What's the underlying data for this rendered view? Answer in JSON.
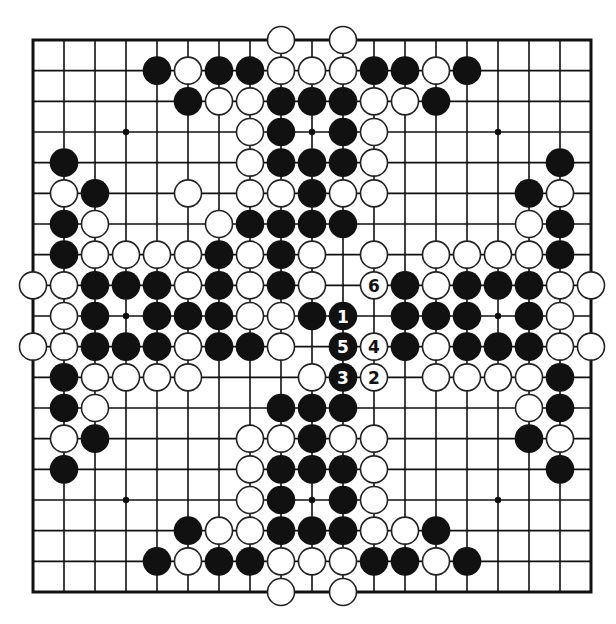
{
  "diagram": {
    "type": "go-board",
    "size": 19,
    "geometry": {
      "left": 33,
      "top": 40,
      "right": 591,
      "bottom": 592,
      "stone_radius": 14.3,
      "border_width": 3,
      "line_width": 1.6,
      "star_radius": 3.2
    },
    "colors": {
      "background": "#ffffff",
      "line": "#111111",
      "black_stone": "#111111",
      "white_stone": "#ffffff",
      "white_stone_edge": "#222222",
      "number_on_black": "#ffffff",
      "number_on_white": "#111111"
    },
    "star_points": [
      [
        3,
        3
      ],
      [
        3,
        9
      ],
      [
        3,
        15
      ],
      [
        9,
        3
      ],
      [
        9,
        9
      ],
      [
        9,
        15
      ],
      [
        15,
        3
      ],
      [
        15,
        9
      ],
      [
        15,
        15
      ]
    ],
    "stones": {
      "rows": [
        {
          "row": 0,
          "black": [],
          "white": [
            8,
            10
          ]
        },
        {
          "row": 1,
          "black": [
            4,
            6,
            7,
            11,
            12,
            14
          ],
          "white": [
            5,
            8,
            9,
            10,
            13
          ]
        },
        {
          "row": 2,
          "black": [
            5,
            8,
            9,
            10,
            13
          ],
          "white": [
            6,
            7,
            11,
            12
          ]
        },
        {
          "row": 3,
          "black": [
            8,
            10
          ],
          "white": [
            7,
            11
          ]
        },
        {
          "row": 4,
          "black": [
            1,
            8,
            9,
            10,
            17
          ],
          "white": [
            7,
            11
          ]
        },
        {
          "row": 5,
          "black": [
            2,
            9,
            16
          ],
          "white": [
            1,
            5,
            7,
            8,
            10,
            11,
            17
          ]
        },
        {
          "row": 6,
          "black": [
            1,
            7,
            8,
            9,
            10,
            17
          ],
          "white": [
            2,
            6,
            16
          ]
        },
        {
          "row": 7,
          "black": [
            1,
            6,
            8,
            17
          ],
          "white": [
            2,
            3,
            4,
            5,
            7,
            9,
            11,
            13,
            14,
            15,
            16
          ]
        },
        {
          "row": 8,
          "black": [
            2,
            3,
            4,
            6,
            8,
            12,
            14,
            15,
            16
          ],
          "white": [
            0,
            1,
            5,
            7,
            9,
            13,
            17,
            18
          ]
        },
        {
          "row": 9,
          "black": [
            2,
            4,
            5,
            6,
            9,
            12,
            13,
            14,
            16
          ],
          "white": [
            1,
            7,
            8,
            17
          ]
        },
        {
          "row": 10,
          "black": [
            2,
            3,
            4,
            6,
            7,
            12,
            14,
            15,
            16
          ],
          "white": [
            0,
            1,
            5,
            8,
            13,
            17,
            18
          ]
        },
        {
          "row": 11,
          "black": [
            1,
            17
          ],
          "white": [
            2,
            3,
            4,
            5,
            9,
            13,
            14,
            15,
            16
          ]
        },
        {
          "row": 12,
          "black": [
            1,
            8,
            9,
            10,
            17
          ],
          "white": [
            2,
            16
          ]
        },
        {
          "row": 13,
          "black": [
            2,
            9,
            16
          ],
          "white": [
            1,
            7,
            8,
            10,
            11,
            17
          ]
        },
        {
          "row": 14,
          "black": [
            1,
            8,
            9,
            10,
            17
          ],
          "white": [
            7,
            11
          ]
        },
        {
          "row": 15,
          "black": [
            8,
            10
          ],
          "white": [
            7,
            11
          ]
        },
        {
          "row": 16,
          "black": [
            5,
            8,
            9,
            10,
            13
          ],
          "white": [
            6,
            7,
            11,
            12
          ]
        },
        {
          "row": 17,
          "black": [
            4,
            6,
            7,
            11,
            12,
            14
          ],
          "white": [
            5,
            8,
            9,
            10,
            13
          ]
        },
        {
          "row": 18,
          "black": [],
          "white": [
            8,
            10
          ]
        }
      ]
    },
    "numbered_moves": [
      {
        "label": "1",
        "color": "black",
        "row": 9,
        "col": 10
      },
      {
        "label": "2",
        "color": "white",
        "row": 11,
        "col": 11
      },
      {
        "label": "3",
        "color": "black",
        "row": 11,
        "col": 10
      },
      {
        "label": "4",
        "color": "white",
        "row": 10,
        "col": 11
      },
      {
        "label": "5",
        "color": "black",
        "row": 10,
        "col": 10
      },
      {
        "label": "6",
        "color": "white",
        "row": 8,
        "col": 11
      }
    ]
  }
}
